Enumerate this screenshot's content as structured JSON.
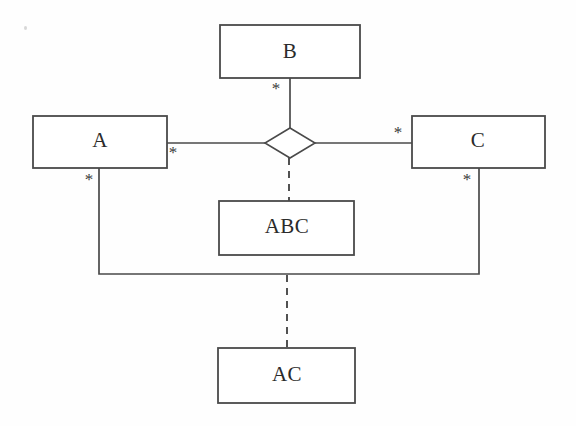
{
  "diagram": {
    "canvas": {
      "width": 576,
      "height": 426,
      "background": "#fefefe"
    },
    "stroke_color": "#4a4a4a",
    "text_color": "#2b2b2b",
    "entities": [
      {
        "id": "B",
        "label": "B",
        "x": 220,
        "y": 25,
        "w": 140,
        "h": 53
      },
      {
        "id": "A",
        "label": "A",
        "x": 33,
        "y": 116,
        "w": 134,
        "h": 52
      },
      {
        "id": "C",
        "label": "C",
        "x": 412,
        "y": 116,
        "w": 133,
        "h": 52
      },
      {
        "id": "ABC",
        "label": "ABC",
        "x": 219,
        "y": 201,
        "w": 135,
        "h": 54
      },
      {
        "id": "AC",
        "label": "AC",
        "x": 218,
        "y": 348,
        "w": 137,
        "h": 55
      }
    ],
    "association_diamond": {
      "id": "ternary-diamond",
      "cx": 290,
      "cy": 143,
      "rx": 25,
      "ry": 15
    },
    "multiplicities": [
      {
        "id": "b-end",
        "label": "*",
        "x": 276,
        "y": 89,
        "for": "B"
      },
      {
        "id": "a-end",
        "label": "*",
        "x": 173,
        "y": 153,
        "for": "A"
      },
      {
        "id": "c-end",
        "label": "*",
        "x": 398,
        "y": 133,
        "for": "C"
      },
      {
        "id": "a-down",
        "label": "*",
        "x": 89,
        "y": 180,
        "for": "A"
      },
      {
        "id": "c-down",
        "label": "*",
        "x": 467,
        "y": 180,
        "for": "C"
      }
    ],
    "connectors": [
      {
        "id": "b-to-diamond",
        "style": "solid",
        "from": "B",
        "to": "ternary-diamond"
      },
      {
        "id": "a-to-diamond",
        "style": "solid",
        "from": "A",
        "to": "ternary-diamond"
      },
      {
        "id": "c-to-diamond",
        "style": "solid",
        "from": "C",
        "to": "ternary-diamond"
      },
      {
        "id": "diamond-to-abc",
        "style": "dashed",
        "from": "ternary-diamond",
        "to": "ABC"
      },
      {
        "id": "a-to-c-binary",
        "style": "solid",
        "from": "A",
        "to": "C"
      },
      {
        "id": "binary-to-ac",
        "style": "dashed",
        "from": "a-to-c-binary",
        "to": "AC"
      }
    ]
  }
}
